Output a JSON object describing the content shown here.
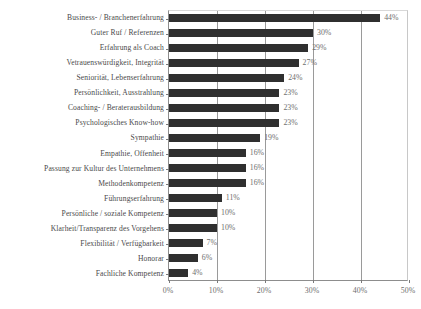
{
  "chart_data": {
    "type": "bar",
    "orientation": "horizontal",
    "title": "",
    "xlabel": "",
    "ylabel": "",
    "xlim": [
      0,
      50
    ],
    "xticks": [
      "0%",
      "10%",
      "20%",
      "30%",
      "40%",
      "50%"
    ],
    "xtick_values": [
      0,
      10,
      20,
      30,
      40,
      50
    ],
    "grid": "vertical",
    "legend": "none",
    "bar_color": "#2f2f2f",
    "label_color": "#6e6e6e",
    "categories": [
      "Business- / Branchenerfahrung",
      "Guter Ruf / Referenzen",
      "Erfahrung als Coach",
      "Vetrauenswürdigkeit, Integrität",
      "Seniorität, Lebenserfahrung",
      "Persönlichkeit, Ausstrahlung",
      "Coaching- / Beraterausbildung",
      "Psychologisches Know-how",
      "Sympathie",
      "Empathie, Offenheit",
      "Passung zur Kultur des Unternehmens",
      "Methodenkompetenz",
      "Führungserfahrung",
      "Persönliche / soziale Kompetenz",
      "Klarheit/Transparenz des Vorgehens",
      "Flexibilität / Verfügbarkeit",
      "Honorar",
      "Fachliche Kompetenz"
    ],
    "values": [
      44,
      30,
      29,
      27,
      24,
      23,
      23,
      23,
      19,
      16,
      16,
      16,
      11,
      10,
      10,
      7,
      6,
      4
    ],
    "value_labels": [
      "44%",
      "30%",
      "29%",
      "27%",
      "24%",
      "23%",
      "23%",
      "23%",
      "19%",
      "16%",
      "16%",
      "16%",
      "11%",
      "10%",
      "10%",
      "7%",
      "6%",
      "4%"
    ]
  }
}
